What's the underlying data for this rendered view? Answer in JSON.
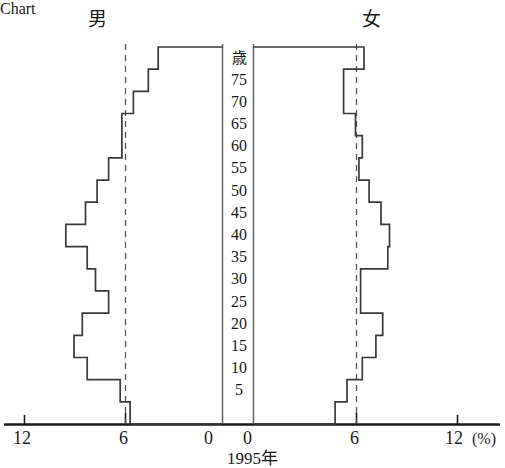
{
  "header": {
    "male_label": "男",
    "female_label": "女"
  },
  "axis": {
    "age_unit_label": "歳",
    "year_label_number": "1995",
    "year_label_suffix": "年",
    "percent_unit": "(%)",
    "age_ticks": [
      "75",
      "70",
      "65",
      "60",
      "55",
      "50",
      "45",
      "40",
      "35",
      "30",
      "25",
      "20",
      "15",
      "10",
      "5"
    ],
    "x_ticks_left": [
      "12",
      "6",
      "0"
    ],
    "x_ticks_right": [
      "0",
      "6",
      "12"
    ],
    "reference_line_value": "6"
  },
  "colors": {
    "background": "#ffffff",
    "ink": "#1a1a1a",
    "outline": "#3a3a3a",
    "dashed": "#555555"
  },
  "chart_data": {
    "type": "bar",
    "subtype": "population-pyramid",
    "title": "1995年",
    "xlabel": "(%)",
    "ylabel": "歳",
    "xlim_left": [
      12,
      0
    ],
    "xlim_right": [
      0,
      12
    ],
    "grid": false,
    "reference_lines": [
      6
    ],
    "legend_position": "top",
    "orientation": "horizontal",
    "categories": [
      "80+",
      "75-79",
      "70-74",
      "65-69",
      "60-64",
      "55-59",
      "50-54",
      "45-49",
      "40-44",
      "35-39",
      "30-34",
      "25-29",
      "20-24",
      "15-19",
      "10-14",
      "5-9",
      "0-4"
    ],
    "series": [
      {
        "name": "男",
        "side": "left",
        "values": [
          3.9,
          4.5,
          5.4,
          6.1,
          6.1,
          6.9,
          7.6,
          8.3,
          9.5,
          8.2,
          7.7,
          6.9,
          8.5,
          9.0,
          8.2,
          6.2,
          5.6
        ]
      },
      {
        "name": "女",
        "side": "right",
        "values": [
          6.5,
          5.3,
          5.3,
          6.0,
          6.4,
          6.2,
          6.8,
          7.5,
          8.0,
          7.9,
          6.3,
          6.3,
          7.6,
          7.2,
          6.4,
          5.5,
          4.8
        ]
      }
    ]
  }
}
